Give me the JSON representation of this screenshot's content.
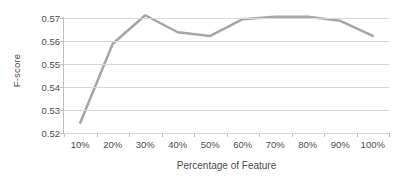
{
  "chart_data": {
    "type": "line",
    "title": "",
    "subtitle": "",
    "xlabel": "Percentage of Feature",
    "ylabel": "F-score",
    "categories": [
      "10%",
      "20%",
      "30%",
      "40%",
      "50%",
      "60%",
      "70%",
      "80%",
      "90%",
      "100%"
    ],
    "values": [
      0.5245,
      0.5588,
      0.5712,
      0.5638,
      0.5622,
      0.5695,
      0.5705,
      0.5705,
      0.5688,
      0.5622
    ],
    "series": [
      {
        "name": "F-score",
        "values": [
          0.5245,
          0.5588,
          0.5712,
          0.5638,
          0.5622,
          0.5695,
          0.5705,
          0.5705,
          0.5688,
          0.5622
        ],
        "color": "#a6a6a6"
      }
    ],
    "ylim": [
      0.52,
      0.57
    ],
    "yticks": [
      0.52,
      0.53,
      0.54,
      0.55,
      0.56,
      0.57
    ],
    "ytick_labels": [
      "0.52",
      "0.53",
      "0.54",
      "0.55",
      "0.56",
      "0.57"
    ],
    "grid": true,
    "grid_axis": "y",
    "legend": false,
    "legend_position": "none",
    "markers": false,
    "line_width": 2.5,
    "colors": {
      "line": "#a6a6a6",
      "grid": "#d9d9d9",
      "axis": "#bfbfbf",
      "text": "#4d4d4d",
      "background": "#ffffff"
    },
    "annotations": []
  }
}
